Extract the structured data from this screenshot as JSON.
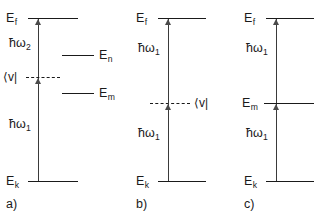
{
  "figure": {
    "ink_color": "#1a1a1a",
    "arrow_color": "#4a4a4a",
    "background": "#ffffff"
  },
  "panels": [
    {
      "id": "a",
      "caption": "a)",
      "initial_level_label": "E",
      "initial_level_sub": "k",
      "final_level_label": "E",
      "final_level_sub": "f",
      "lower_photon": "ħω",
      "lower_photon_sub": "1",
      "upper_photon": "ħω",
      "upper_photon_sub": "2",
      "intermediate_type": "virtual",
      "intermediate_label": "⟨v|",
      "intermediate_label_side": "left",
      "extra_levels": [
        {
          "label": "E",
          "sub": "n",
          "position": "upper-right"
        },
        {
          "label": "E",
          "sub": "m",
          "position": "lower-right"
        }
      ]
    },
    {
      "id": "b",
      "caption": "b)",
      "initial_level_label": "E",
      "initial_level_sub": "k",
      "final_level_label": "E",
      "final_level_sub": "f",
      "lower_photon": "ħω",
      "lower_photon_sub": "1",
      "upper_photon": "ħω",
      "upper_photon_sub": "1",
      "intermediate_type": "virtual",
      "intermediate_label": "⟨v|",
      "intermediate_label_side": "right",
      "extra_levels": []
    },
    {
      "id": "c",
      "caption": "c)",
      "initial_level_label": "E",
      "initial_level_sub": "k",
      "final_level_label": "E",
      "final_level_sub": "f",
      "lower_photon": "ħω",
      "lower_photon_sub": "1",
      "upper_photon": "ħω",
      "upper_photon_sub": "1",
      "intermediate_type": "real",
      "intermediate_label": "E",
      "intermediate_label_sub": "m",
      "intermediate_label_side": "left",
      "extra_levels": []
    }
  ]
}
